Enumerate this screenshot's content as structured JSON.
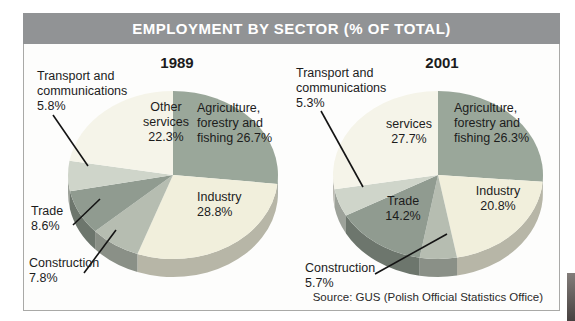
{
  "header": {
    "title": "EMPLOYMENT BY SECTOR (% OF TOTAL)"
  },
  "source_text": "Source: GUS (Polish Official Statistics Office)",
  "colors": {
    "header_bg": "#919395",
    "panel_border": "#a9a9a7",
    "label_text": "#1c1c1c",
    "leader_line": "#141414"
  },
  "chart_data": [
    {
      "type": "pie",
      "title": "1989",
      "clockwise_from_top": true,
      "slices": [
        {
          "label": "Agriculture, forestry and fishing",
          "value": 26.7,
          "color": "#9aa79a"
        },
        {
          "label": "Industry",
          "value": 28.8,
          "color": "#f1efdc"
        },
        {
          "label": "Construction",
          "value": 7.8,
          "color": "#b6bdb1"
        },
        {
          "label": "Trade",
          "value": 8.6,
          "color": "#909b90"
        },
        {
          "label": "Transport and communications",
          "value": 5.8,
          "color": "#cfd5ca"
        },
        {
          "label": "Other services",
          "value": 22.3,
          "color": "#f5f4e9"
        }
      ],
      "labels": {
        "transport": {
          "l1": "Transport and",
          "l2": "communications",
          "l3": "5.8%"
        },
        "services": {
          "l1": "Other",
          "l2": "services",
          "l3": "22.3%"
        },
        "agriculture": {
          "l1": "Agriculture,",
          "l2": "forestry and",
          "l3": "fishing 26.7%"
        },
        "industry": {
          "l1": "Industry",
          "l2": "28.8%"
        },
        "trade": {
          "l1": "Trade",
          "l2": "8.6%"
        },
        "construction": {
          "l1": "Construction",
          "l2": "7.8%"
        }
      }
    },
    {
      "type": "pie",
      "title": "2001",
      "clockwise_from_top": true,
      "slices": [
        {
          "label": "Agriculture, forestry and fishing",
          "value": 26.3,
          "color": "#9aa79a"
        },
        {
          "label": "Industry",
          "value": 20.8,
          "color": "#f1efdc"
        },
        {
          "label": "Construction",
          "value": 5.7,
          "color": "#b6bdb1"
        },
        {
          "label": "Trade",
          "value": 14.2,
          "color": "#909b90"
        },
        {
          "label": "Transport and communications",
          "value": 5.3,
          "color": "#cfd5ca"
        },
        {
          "label": "services",
          "value": 27.7,
          "color": "#f5f4e9"
        }
      ],
      "labels": {
        "transport": {
          "l1": "Transport and",
          "l2": "communications",
          "l3": "5.3%"
        },
        "services": {
          "l1": "services",
          "l2": "27.7%"
        },
        "agriculture": {
          "l1": "Agriculture,",
          "l2": "forestry and",
          "l3": "fishing 26.3%"
        },
        "industry": {
          "l1": "Industry",
          "l2": "20.8%"
        },
        "trade": {
          "l1": "Trade",
          "l2": "14.2%"
        },
        "construction": {
          "l1": "Construction",
          "l2": "5.7%"
        }
      }
    }
  ]
}
